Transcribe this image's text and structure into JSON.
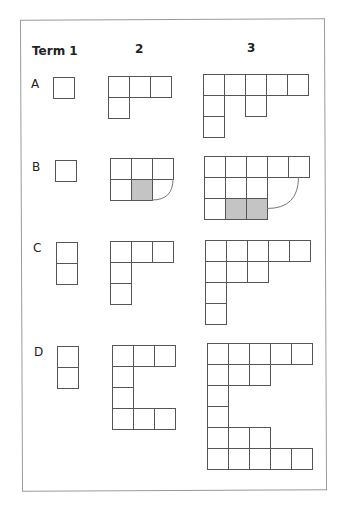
{
  "headers": {
    "term1": "Term 1",
    "term2": "2",
    "term3": "3"
  },
  "rows": [
    {
      "label": "A"
    },
    {
      "label": "B"
    },
    {
      "label": "C"
    },
    {
      "label": "D"
    }
  ],
  "colors": {
    "stroke": "#555555",
    "shaded": "#c4c4c4",
    "frame": "#9a9a9a"
  },
  "cell_size": 21,
  "figures": [
    {
      "row": "A",
      "term": 1,
      "origin": [
        53,
        77
      ],
      "cells": [
        [
          0,
          0
        ]
      ]
    },
    {
      "row": "A",
      "term": 2,
      "origin": [
        108,
        76
      ],
      "cells": [
        [
          0,
          0
        ],
        [
          1,
          0
        ],
        [
          2,
          0
        ],
        [
          0,
          1
        ]
      ]
    },
    {
      "row": "A",
      "term": 3,
      "origin": [
        203,
        74
      ],
      "cells": [
        [
          0,
          0
        ],
        [
          1,
          0
        ],
        [
          2,
          0
        ],
        [
          3,
          0
        ],
        [
          4,
          0
        ],
        [
          0,
          1
        ],
        [
          2,
          1
        ],
        [
          0,
          2
        ]
      ]
    },
    {
      "row": "B",
      "term": 1,
      "origin": [
        55,
        160
      ],
      "cells": [
        [
          0,
          0
        ]
      ]
    },
    {
      "row": "B",
      "term": 2,
      "origin": [
        110,
        158
      ],
      "cells": [
        [
          0,
          0
        ],
        [
          1,
          0
        ],
        [
          2,
          0
        ],
        [
          0,
          1
        ],
        [
          1,
          1,
          "shaded"
        ]
      ],
      "arc": {
        "from": [
          3,
          1
        ],
        "to": [
          2,
          2
        ]
      }
    },
    {
      "row": "B",
      "term": 3,
      "origin": [
        204,
        156
      ],
      "cells": [
        [
          0,
          0
        ],
        [
          1,
          0
        ],
        [
          2,
          0
        ],
        [
          3,
          0
        ],
        [
          4,
          0
        ],
        [
          0,
          1
        ],
        [
          1,
          1
        ],
        [
          2,
          1
        ],
        [
          0,
          2
        ],
        [
          1,
          2,
          "shaded"
        ],
        [
          2,
          2,
          "shaded"
        ]
      ],
      "arc": {
        "from": [
          4.5,
          1
        ],
        "to": [
          3,
          2.5
        ]
      }
    },
    {
      "row": "C",
      "term": 1,
      "origin": [
        56,
        242
      ],
      "cells": [
        [
          0,
          0
        ],
        [
          0,
          1
        ]
      ]
    },
    {
      "row": "C",
      "term": 2,
      "origin": [
        110,
        241
      ],
      "cells": [
        [
          0,
          0
        ],
        [
          1,
          0
        ],
        [
          2,
          0
        ],
        [
          0,
          1
        ],
        [
          0,
          2
        ]
      ]
    },
    {
      "row": "C",
      "term": 3,
      "origin": [
        205,
        240
      ],
      "cells": [
        [
          0,
          0
        ],
        [
          1,
          0
        ],
        [
          2,
          0
        ],
        [
          3,
          0
        ],
        [
          4,
          0
        ],
        [
          0,
          1
        ],
        [
          1,
          1
        ],
        [
          2,
          1
        ],
        [
          0,
          2
        ],
        [
          0,
          3
        ]
      ]
    },
    {
      "row": "D",
      "term": 1,
      "origin": [
        57,
        346
      ],
      "cells": [
        [
          0,
          0
        ],
        [
          0,
          1
        ]
      ]
    },
    {
      "row": "D",
      "term": 2,
      "origin": [
        112,
        345
      ],
      "cells": [
        [
          0,
          0
        ],
        [
          1,
          0
        ],
        [
          2,
          0
        ],
        [
          0,
          1
        ],
        [
          0,
          2
        ],
        [
          0,
          3
        ],
        [
          1,
          3
        ],
        [
          2,
          3
        ]
      ]
    },
    {
      "row": "D",
      "term": 3,
      "origin": [
        207,
        343
      ],
      "cells": [
        [
          0,
          0
        ],
        [
          1,
          0
        ],
        [
          2,
          0
        ],
        [
          3,
          0
        ],
        [
          4,
          0
        ],
        [
          0,
          1
        ],
        [
          1,
          1
        ],
        [
          2,
          1
        ],
        [
          0,
          2
        ],
        [
          0,
          3
        ],
        [
          0,
          4
        ],
        [
          1,
          4
        ],
        [
          2,
          4
        ],
        [
          0,
          5
        ],
        [
          1,
          5
        ],
        [
          2,
          5
        ],
        [
          3,
          5
        ],
        [
          4,
          5
        ]
      ]
    }
  ]
}
